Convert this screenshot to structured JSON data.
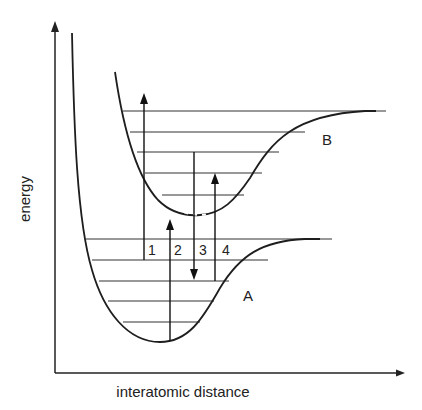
{
  "diagram": {
    "type": "potential-energy-curves",
    "axes": {
      "y_label": "energy",
      "x_label": "interatomic distance"
    },
    "curves": [
      {
        "id": "A",
        "label": "A",
        "role": "ground state",
        "vibrational_levels": 5
      },
      {
        "id": "B",
        "label": "B",
        "role": "excited state",
        "vibrational_levels": 5
      }
    ],
    "transitions": [
      {
        "label": "1",
        "direction": "up",
        "from": "A level 2",
        "to": "above B"
      },
      {
        "label": "2",
        "direction": "up",
        "from": "A bottom",
        "to": "B bottom"
      },
      {
        "label": "3",
        "direction": "down",
        "from": "B level 3",
        "to": "A level 3"
      },
      {
        "label": "4",
        "direction": "up",
        "from": "A level 3",
        "to": "B level 4"
      }
    ],
    "colors": {
      "stroke": "#1e1e1e",
      "background": "#ffffff"
    }
  }
}
